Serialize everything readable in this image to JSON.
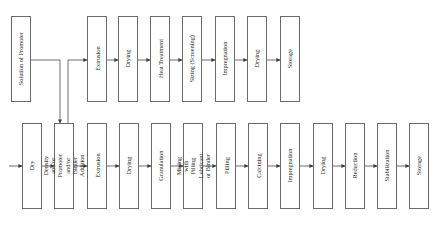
{
  "diagram": {
    "type": "process-flowchart",
    "orientation": "rotated-labels",
    "top_row": {
      "source": {
        "label": "Solution of Promoter",
        "x": 11,
        "w": 19
      },
      "steps": [
        {
          "label": "Extrusion",
          "x": 87
        },
        {
          "label": "Drying",
          "x": 118
        },
        {
          "label": "Heat Treatment",
          "x": 150
        },
        {
          "label": "Sizing (Screening)",
          "x": 182
        },
        {
          "label": "Impregnation",
          "x": 215
        },
        {
          "label": "Drying",
          "x": 247
        },
        {
          "label": "Storage",
          "x": 280
        }
      ],
      "y": 16,
      "h": 85
    },
    "bottom_row": {
      "steps": [
        {
          "label": "Dry",
          "x": 22
        },
        {
          "label": "Density and/or Promoter and/or Binder Addition",
          "x": 54
        },
        {
          "label": "Extrusion",
          "x": 87
        },
        {
          "label": "Drying",
          "x": 119
        },
        {
          "label": "Granulation",
          "x": 151
        },
        {
          "label": "Mixing with Pilling Lubricant or Binder",
          "x": 183
        },
        {
          "label": "Pilling",
          "x": 216
        },
        {
          "label": "Calcining",
          "x": 248
        },
        {
          "label": "Impregnation",
          "x": 280
        },
        {
          "label": "Drying",
          "x": 313
        },
        {
          "label": "Reduction",
          "x": 345
        },
        {
          "label": "Stabilization",
          "x": 377
        },
        {
          "label": "Storage",
          "x": 409
        }
      ],
      "y": 123,
      "h": 86
    },
    "colors": {
      "line": "#4a4a4a",
      "box_border": "#6a6a6a",
      "text": "#2b2b2b"
    }
  },
  "labels": {
    "t0": "Solution of Promoter",
    "t1": "Extrusion",
    "t2": "Drying",
    "t3": "Heat Treatment",
    "t4": "Sizing (Screening)",
    "t5": "Impregnation",
    "t6": "Drying",
    "t7": "Storage",
    "b0": "Dry",
    "b1": "Density and/or Promoter and/or Binder Addition",
    "b2": "Extrusion",
    "b3": "Drying",
    "b4": "Granulation",
    "b5": "Mixing with Pilling Lubricant or Binder",
    "b6": "Pilling",
    "b7": "Calcining",
    "b8": "Impregnation",
    "b9": "Drying",
    "b10": "Reduction",
    "b11": "Stabilization",
    "b12": "Storage"
  }
}
